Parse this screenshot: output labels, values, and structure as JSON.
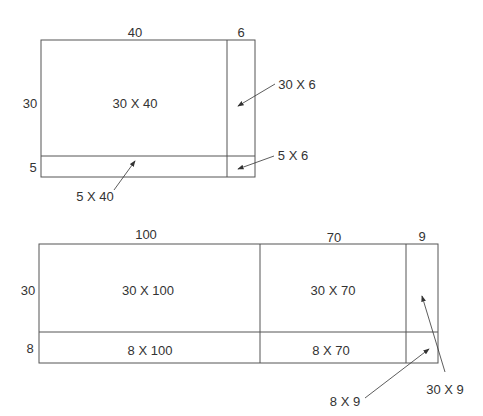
{
  "diagram1": {
    "dims": {
      "width_a": "40",
      "width_b": "6",
      "height_a": "30",
      "height_b": "5"
    },
    "cells": {
      "main": "30 X 40",
      "right": "30 X 6",
      "bottom": "5 X 40",
      "corner": "5 X 6"
    }
  },
  "diagram2": {
    "dims": {
      "width_a": "100",
      "width_b": "70",
      "width_c": "9",
      "height_a": "30",
      "height_b": "8"
    },
    "cells": {
      "top_a": "30 X 100",
      "top_b": "30 X 70",
      "top_c": "30 X 9",
      "bottom_a": "8 X 100",
      "bottom_b": "8 X 70",
      "bottom_c": "8 X 9"
    }
  },
  "colors": {
    "line": "#555555",
    "text": "#333333"
  }
}
